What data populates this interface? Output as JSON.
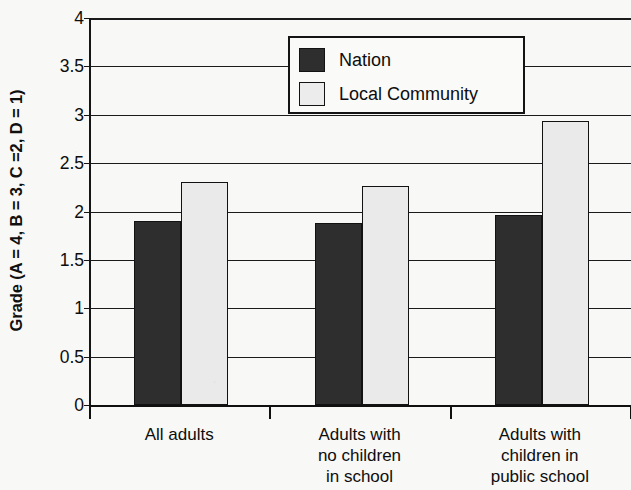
{
  "chart_data": {
    "type": "bar",
    "title": "",
    "xlabel": "",
    "ylabel": "Grade (A = 4, B = 3, C =2, D = 1)",
    "ylim": [
      0,
      4
    ],
    "yticks": [
      "0",
      "0.5",
      "1",
      "1.5",
      "2",
      "2.5",
      "3",
      "3.5",
      "4"
    ],
    "ytick_values": [
      0,
      0.5,
      1,
      1.5,
      2,
      2.5,
      3,
      3.5,
      4
    ],
    "grid": true,
    "legend_position": "top-right-inside",
    "categories": [
      "All adults",
      "Adults with no children in school",
      "Adults with children in public school"
    ],
    "category_lines": [
      [
        "All adults"
      ],
      [
        "Adults with",
        "no children",
        "in school"
      ],
      [
        "Adults with",
        "children in",
        "public school"
      ]
    ],
    "series": [
      {
        "name": "Nation",
        "color": "#2e2e2e",
        "values": [
          1.9,
          1.88,
          1.96
        ]
      },
      {
        "name": "Local Community",
        "color": "#eaeaea",
        "values": [
          2.31,
          2.26,
          2.94
        ]
      }
    ]
  },
  "legend": {
    "items": [
      {
        "label": "Nation"
      },
      {
        "label": "Local Community"
      }
    ]
  },
  "colors": {
    "nation": "#2e2e2e",
    "local_community": "#eaeaea",
    "axis": "#101010",
    "background": "#f8f8f6"
  }
}
